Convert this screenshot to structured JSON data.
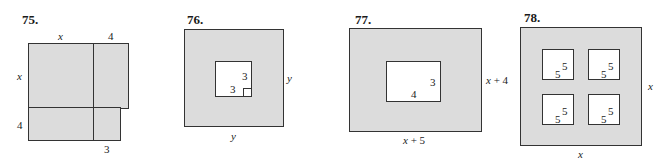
{
  "figures": [
    {
      "number": "75.",
      "labels": {
        "top_left": "x",
        "top_right": "4",
        "left_top": "x",
        "left_bottom": "4",
        "bottom_right": "3"
      }
    },
    {
      "number": "76.",
      "labels": {
        "inner_side_v": "3",
        "inner_side_h": "3",
        "outer_right": "y",
        "outer_bottom": "y"
      }
    },
    {
      "number": "77.",
      "labels": {
        "inner_side_v": "3",
        "inner_side_h": "4",
        "outer_right": "x + 4",
        "outer_bottom": "x + 5"
      }
    },
    {
      "number": "78.",
      "labels": {
        "holes": [
          {
            "a": "5",
            "b": "5"
          },
          {
            "a": "5",
            "b": "5"
          },
          {
            "a": "5",
            "b": "5"
          },
          {
            "a": "5",
            "b": "5"
          }
        ],
        "outer_right": "x",
        "outer_bottom": "x"
      }
    }
  ],
  "colors": {
    "fill": "#dcdcdc",
    "stroke": "#333333",
    "hole": "#ffffff"
  }
}
